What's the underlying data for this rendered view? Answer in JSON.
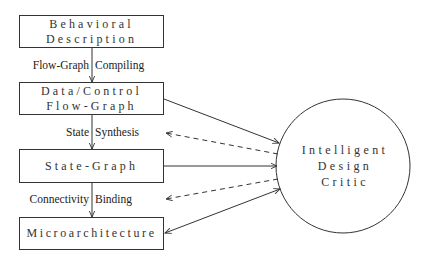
{
  "diagram": {
    "boxes": [
      {
        "id": "behavioral-description",
        "lines": [
          "Behavioral",
          "Description"
        ]
      },
      {
        "id": "data-control-flow-graph",
        "lines": [
          "Data/Control",
          "Flow-Graph"
        ]
      },
      {
        "id": "state-graph",
        "lines": [
          "State-Graph"
        ]
      },
      {
        "id": "microarchitecture",
        "lines": [
          "Microarchitecture"
        ]
      }
    ],
    "edge_labels": [
      {
        "left": "Flow-Graph",
        "right": "Compiling"
      },
      {
        "left": "State",
        "right": "Synthesis"
      },
      {
        "left": "Connectivity",
        "right": "Binding"
      }
    ],
    "critic": {
      "lines": [
        "Intelligent",
        "Design",
        "Critic"
      ]
    },
    "colors": {
      "stroke": "#333333",
      "background": "#ffffff"
    }
  }
}
